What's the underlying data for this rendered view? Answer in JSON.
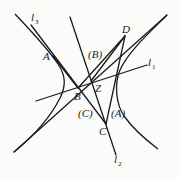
{
  "diagram": {
    "points": {
      "A": "A",
      "B": "B",
      "C": "C",
      "D": "D",
      "Z": "Z"
    },
    "region_labels": {
      "A": "(A)",
      "B": "(B)",
      "C": "(C)"
    },
    "lines": {
      "l1": {
        "base": "l",
        "sub": "1"
      },
      "l2": {
        "base": "l",
        "sub": "2"
      },
      "l3": {
        "base": "l",
        "sub": "3"
      }
    },
    "colors": {
      "stroke": "#1a1a1a",
      "background": "#fbfbfa"
    }
  }
}
